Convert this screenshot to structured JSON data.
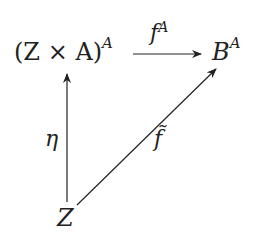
{
  "diagram": {
    "type": "commutative-diagram",
    "nodes": {
      "top_left": {
        "base": "(Z × A)",
        "sup": "A"
      },
      "top_right": {
        "base": "B",
        "sup": "A"
      },
      "bottom": {
        "base": "Z"
      }
    },
    "arrows": {
      "horizontal": {
        "from": "(Z × A)^A",
        "to": "B^A",
        "label_base": "f",
        "label_sup": "A"
      },
      "vertical": {
        "from": "Z",
        "to": "(Z × A)^A",
        "label": "η"
      },
      "diagonal": {
        "from": "Z",
        "to": "B^A",
        "label": "f̃"
      }
    },
    "colors": {
      "ink": "#222222",
      "background": "#ffffff"
    }
  }
}
